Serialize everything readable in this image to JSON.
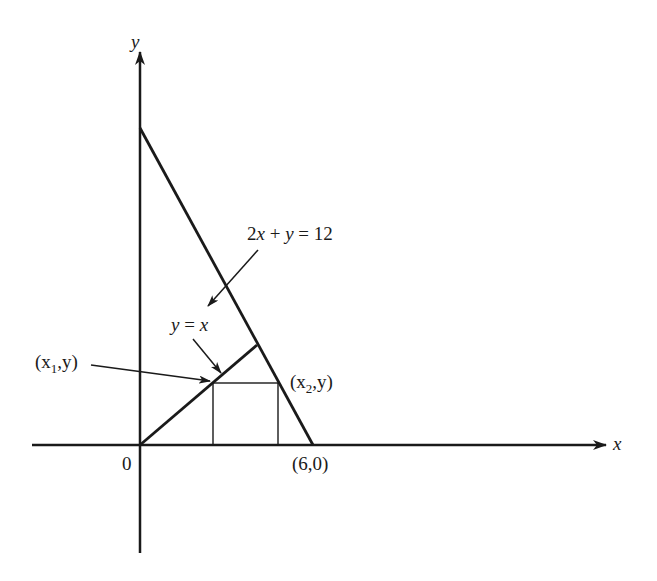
{
  "diagram": {
    "axes": {
      "x_label": "x",
      "y_label": "y",
      "origin_label": "0"
    },
    "lines": [
      {
        "name": "constraint-line",
        "equation": "2x + y = 12",
        "label": "2x + y = 12"
      },
      {
        "name": "identity-line",
        "equation": "y = x",
        "label": "y = x"
      }
    ],
    "points": {
      "intercept": "(6,0)",
      "x1_point": {
        "pre": "(x",
        "sub": "1",
        "post": ",y)"
      },
      "x2_point": {
        "pre": "(x",
        "sub": "2",
        "post": ",y)"
      }
    },
    "labels": {
      "line1_part1": "2",
      "line1_part2": "x",
      "line1_part3": " + ",
      "line1_part4": "y",
      "line1_part5": " = 12",
      "line2_part1": "y",
      "line2_part2": " = ",
      "line2_part3": "x"
    }
  }
}
